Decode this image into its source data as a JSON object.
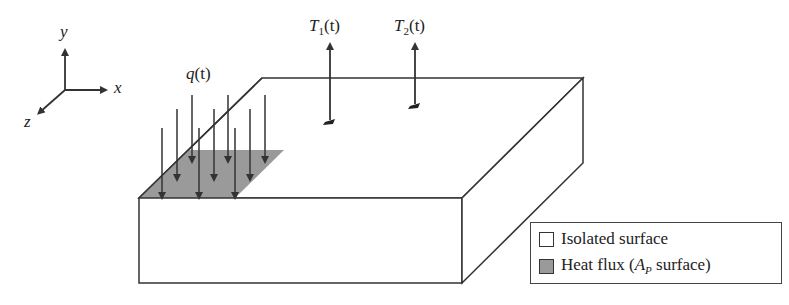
{
  "axes": {
    "x_label": "x",
    "y_label": "y",
    "z_label": "z"
  },
  "labels": {
    "heat_flux": {
      "symbol": "q",
      "arg": "(t)"
    },
    "sensor_1": {
      "symbol": "T",
      "sub": "1",
      "arg": "(t)"
    },
    "sensor_2": {
      "symbol": "T",
      "sub": "2",
      "arg": "(t)"
    }
  },
  "legend": {
    "items": [
      {
        "label": "Isolated surface",
        "color": "#ffffff"
      },
      {
        "label_prefix": "Heat flux (",
        "label_symbol": "A",
        "label_sub": "P",
        "label_suffix": " surface)",
        "color": "#9a9a9a"
      }
    ]
  },
  "colors": {
    "line": "#333333",
    "heat_flux_area": "#9a9a9a",
    "background": "#ffffff"
  }
}
